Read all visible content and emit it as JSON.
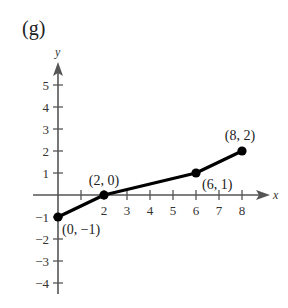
{
  "panel_label": "(g)",
  "chart_data": {
    "type": "line",
    "title": "",
    "xlabel": "x",
    "ylabel": "y",
    "xlim": [
      -1,
      9
    ],
    "ylim": [
      -4,
      6
    ],
    "grid": false,
    "legend": null,
    "x_ticks": [
      1,
      2,
      3,
      4,
      5,
      6,
      7,
      8
    ],
    "x_tick_labels": [
      "2",
      "3",
      "4",
      "5",
      "6",
      "7",
      "8"
    ],
    "y_ticks": [
      -4,
      -3,
      -2,
      -1,
      1,
      2,
      3,
      4,
      5
    ],
    "y_tick_labels": [
      "-4",
      "-3",
      "-2",
      "-1",
      "1",
      "2",
      "3",
      "4",
      "5"
    ],
    "series": [
      {
        "name": "piecewise linear",
        "x": [
          0,
          2,
          6,
          8
        ],
        "y": [
          -1,
          0,
          1,
          2
        ],
        "color": "#000000",
        "markers": true
      }
    ],
    "annotations": [
      {
        "text": "(0, −1)",
        "x": 0,
        "y": -1
      },
      {
        "text": "(2, 0)",
        "x": 2,
        "y": 0
      },
      {
        "text": "(6, 1)",
        "x": 6,
        "y": 1
      },
      {
        "text": "(8, 2)",
        "x": 8,
        "y": 2
      }
    ]
  },
  "layout": {
    "origin_px": [
      58,
      195
    ],
    "x_unit_px": 23,
    "y_unit_px": 22,
    "axis_color": "#555555",
    "line_color": "#000000"
  }
}
